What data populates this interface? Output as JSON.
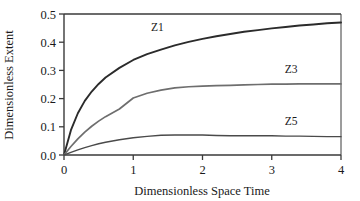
{
  "chart_data": {
    "type": "line",
    "title": "",
    "xlabel": "Dimensionless Space Time",
    "ylabel": "Dimensionless Extent",
    "xlim": [
      0,
      4
    ],
    "ylim": [
      0,
      0.5
    ],
    "xticks": [
      "0",
      "1",
      "2",
      "3",
      "4"
    ],
    "xtick_values": [
      0,
      1,
      2,
      3,
      4
    ],
    "yticks": [
      "0.0",
      "0.1",
      "0.2",
      "0.3",
      "0.4",
      "0.5"
    ],
    "ytick_values": [
      0.0,
      0.1,
      0.2,
      0.3,
      0.4,
      0.5
    ],
    "grid": false,
    "legend": "inline-curve-labels",
    "x": [
      0,
      0.1,
      0.2,
      0.3,
      0.4,
      0.5,
      0.6,
      0.8,
      1.0,
      1.2,
      1.4,
      1.6,
      1.8,
      2.0,
      2.2,
      2.4,
      2.6,
      2.8,
      3.0,
      3.2,
      3.4,
      3.6,
      3.8,
      4.0
    ],
    "series": [
      {
        "name": "Z1",
        "color": "#2b2b2b",
        "width": 1.9,
        "label_x": 1.35,
        "label_y": 0.438,
        "values": [
          0.0,
          0.088,
          0.148,
          0.192,
          0.225,
          0.252,
          0.275,
          0.309,
          0.337,
          0.358,
          0.374,
          0.389,
          0.401,
          0.412,
          0.421,
          0.429,
          0.437,
          0.443,
          0.449,
          0.454,
          0.459,
          0.463,
          0.467,
          0.47
        ]
      },
      {
        "name": "Z3",
        "color": "#6e6e6e",
        "width": 1.7,
        "label_x": 3.28,
        "label_y": 0.292,
        "values": [
          0.0,
          0.03,
          0.057,
          0.081,
          0.102,
          0.12,
          0.136,
          0.163,
          0.202,
          0.219,
          0.23,
          0.238,
          0.242,
          0.244,
          0.246,
          0.247,
          0.249,
          0.25,
          0.251,
          0.251,
          0.252,
          0.252,
          0.252,
          0.252
        ]
      },
      {
        "name": "Z5",
        "color": "#4a4a4a",
        "width": 1.4,
        "label_x": 3.28,
        "label_y": 0.107,
        "values": [
          0.0,
          0.009,
          0.018,
          0.026,
          0.033,
          0.04,
          0.045,
          0.054,
          0.061,
          0.066,
          0.07,
          0.071,
          0.071,
          0.071,
          0.069,
          0.068,
          0.068,
          0.068,
          0.068,
          0.067,
          0.067,
          0.066,
          0.065,
          0.065
        ]
      }
    ],
    "axis_color": "#3a3a3a",
    "background": "#ffffff"
  },
  "figure": {
    "y_axis_title": "Dimensionless Extent",
    "x_axis_title": "Dimensionless Space Time"
  }
}
